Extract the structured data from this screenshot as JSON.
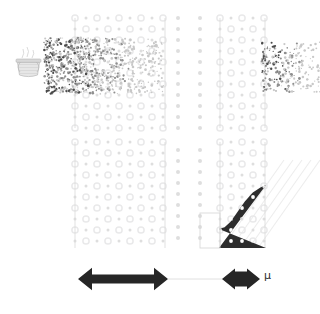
{
  "figure": {
    "title": "",
    "background": "#ffffff",
    "width": 320,
    "height": 314
  },
  "labels": {
    "mu": "μ"
  },
  "colors": {
    "lattice_circle": "#e9e9ea",
    "lattice_ring_accent": "#dedede",
    "guide_line": "#d9d9d9",
    "particle_dark": "#4a4a4a",
    "particle_mid": "#8f8f8f",
    "particle_light": "#c8c8c8",
    "filled_region": "#2d2d2d",
    "filled_region_dot": "#ffffff",
    "arrow": "#262626",
    "thin_connector": "#dcdcdc",
    "basket_body": "#e3e3e3",
    "basket_outline": "#b8b8b8",
    "steam": "#cfcfcf",
    "box_outline": "#d5d5d5",
    "diagonal_hatch": "#ededed",
    "mu_text": "#2b2b2b"
  },
  "elements": {
    "source_icon": {
      "name": "basket-source",
      "x": 16,
      "y": 52,
      "width": 26,
      "height": 24
    },
    "particle_beam_left": {
      "name": "incoming-particle-beam",
      "x": 44,
      "y": 38,
      "width": 120,
      "height": 56,
      "density": "high-near-source"
    },
    "particle_beam_right": {
      "name": "outgoing-particle-beam",
      "x": 262,
      "y": 42,
      "width": 58,
      "height": 50,
      "density": "sparse"
    },
    "lattice_block_upper_left": {
      "name": "lattice-block-upper-left",
      "x": 75,
      "y": 18,
      "width": 90,
      "height": 110
    },
    "lattice_block_lower_left": {
      "name": "lattice-block-lower-left",
      "x": 75,
      "y": 142,
      "width": 90,
      "height": 106
    },
    "lattice_block_upper_right": {
      "name": "lattice-block-upper-right",
      "x": 220,
      "y": 18,
      "width": 45,
      "height": 110
    },
    "lattice_block_lower_right": {
      "name": "lattice-block-lower-right",
      "x": 220,
      "y": 142,
      "width": 45,
      "height": 106
    },
    "sparse_columns": {
      "name": "sparse-lattice-columns",
      "x_positions": [
        178,
        200
      ],
      "y_top": 18,
      "y_bottom": 248
    },
    "filled_region": {
      "name": "filled-state-region",
      "x": 219,
      "y": 185,
      "width": 47,
      "height": 63,
      "boundary": "sigmoid-curve"
    },
    "measure_box": {
      "name": "measurement-box-outline",
      "x": 200,
      "y": 213,
      "width": 20,
      "height": 35
    },
    "arrow_long": {
      "name": "wide-range-arrow",
      "x1": 78,
      "x2": 168,
      "y": 279,
      "style": "double-headed"
    },
    "arrow_short": {
      "name": "mu-range-arrow",
      "x1": 222,
      "x2": 260,
      "y": 279,
      "style": "double-headed"
    },
    "connector": {
      "name": "arrow-connector-line",
      "x1": 168,
      "x2": 222,
      "y": 279
    }
  },
  "chart_data": {
    "type": "diagram",
    "lattice": {
      "spacing_x": 11,
      "spacing_y": 11,
      "rows": 21,
      "style": "open-circles"
    },
    "filled_profile": {
      "xlabel": "",
      "ylabel": "",
      "curve_points": [
        [
          0.0,
          0.3
        ],
        [
          0.12,
          0.33
        ],
        [
          0.25,
          0.42
        ],
        [
          0.4,
          0.58
        ],
        [
          0.55,
          0.74
        ],
        [
          0.72,
          0.88
        ],
        [
          0.88,
          0.96
        ],
        [
          1.0,
          1.0
        ]
      ]
    }
  }
}
